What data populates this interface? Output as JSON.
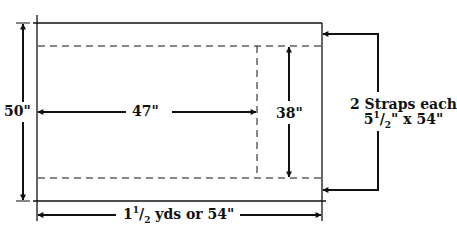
{
  "diagram": {
    "labels": {
      "height": "50\"",
      "inner_width": "47\"",
      "inner_height": "38\"",
      "length_whole": "1",
      "length_frac_num": "1",
      "length_frac_den": "2",
      "length_rest": " yds or 54\"",
      "straps_line1": "2 Straps each",
      "straps_line2_whole": "5",
      "straps_line2_num": "1",
      "straps_line2_den": "2",
      "straps_line2_rest": "\" x 54\""
    },
    "pieces": [
      {
        "name": "main-panel",
        "width": "47\"",
        "height": "38\""
      },
      {
        "name": "strap",
        "count": 2,
        "size": "5 1/2\" x 54\""
      }
    ],
    "fabric": {
      "width": "50\"",
      "length": "1 1/2 yds or 54\""
    },
    "colors": {
      "line": "#111111",
      "background": "#ffffff"
    }
  }
}
